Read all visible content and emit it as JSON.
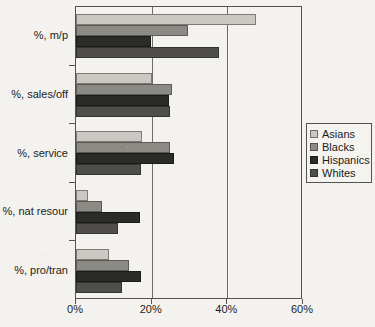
{
  "chart_data": {
    "type": "bar",
    "orientation": "horizontal",
    "title": "",
    "subtitle": "",
    "xlabel": "",
    "ylabel": "",
    "xlim": [
      0,
      60
    ],
    "ylim": null,
    "grid": true,
    "legend_position": "right",
    "categories": [
      "%, m/p",
      "%, sales/off",
      "%, service",
      "%, nat resour",
      "%, pro/tran"
    ],
    "xticks": [
      "0%",
      "20%",
      "40%",
      "60%"
    ],
    "xtick_values": [
      0,
      20,
      40,
      60
    ],
    "series": [
      {
        "name": "Asians",
        "color": "#c9c8c2",
        "values": [
          47.6,
          20.1,
          17.4,
          3.2,
          8.7
        ]
      },
      {
        "name": "Blacks",
        "color": "#8b8a85",
        "values": [
          29.6,
          25.4,
          24.9,
          6.9,
          14.0
        ]
      },
      {
        "name": "Hispanics",
        "color": "#2b2b28",
        "values": [
          19.8,
          24.6,
          25.9,
          16.9,
          17.2
        ]
      },
      {
        "name": "Whites",
        "color": "#4f4e4a",
        "values": [
          37.8,
          24.9,
          17.2,
          11.1,
          12.2
        ]
      }
    ]
  },
  "legend": {
    "entries": [
      {
        "label": "Asians"
      },
      {
        "label": "Blacks"
      },
      {
        "label": "Hispanics"
      },
      {
        "label": "Whites"
      }
    ]
  },
  "colors": {
    "background": "#f3f2ee",
    "axis": "#55534f",
    "gridline": "#6e6c68",
    "text": "#1c1c1a",
    "series_asians": "#c9c8c2",
    "series_blacks": "#8b8a85",
    "series_hispanics": "#2b2b28",
    "series_whites": "#4f4e4a"
  }
}
